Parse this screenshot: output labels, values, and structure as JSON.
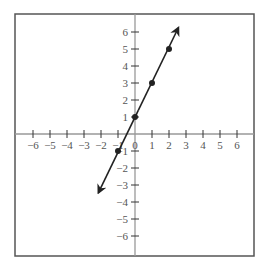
{
  "chart_data": {
    "type": "line",
    "title": "",
    "xlabel": "",
    "ylabel": "",
    "equation": "y = 2x + 1",
    "xlim": [
      -6,
      6
    ],
    "ylim": [
      -6,
      6
    ],
    "grid": false,
    "x_ticks": [
      -6,
      -5,
      -4,
      -3,
      -2,
      -1,
      0,
      1,
      2,
      3,
      4,
      5,
      6
    ],
    "y_ticks": [
      -6,
      -5,
      -4,
      -3,
      -2,
      -1,
      1,
      2,
      3,
      4,
      5,
      6
    ],
    "x_tick_labels": [
      "−6",
      "−5",
      "−4",
      "−3",
      "−2",
      "−1",
      "0",
      "1",
      "2",
      "3",
      "4",
      "5",
      "6"
    ],
    "y_tick_labels": [
      "−6",
      "−5",
      "−4",
      "−3",
      "−2",
      "−1",
      "1",
      "2",
      "3",
      "4",
      "5",
      "6"
    ],
    "series": [
      {
        "name": "line",
        "points": [
          {
            "x": -1,
            "y": -1
          },
          {
            "x": 0,
            "y": 1
          },
          {
            "x": 1,
            "y": 3
          },
          {
            "x": 2,
            "y": 5
          }
        ],
        "arrow_start": {
          "x": -2.15,
          "y": -3.45
        },
        "arrow_end": {
          "x": 2.55,
          "y": 6.25
        }
      }
    ]
  },
  "style": {
    "axis_color": "#999999",
    "frame_color": "#555555",
    "line_color": "#222222",
    "label_color": "#555555"
  }
}
